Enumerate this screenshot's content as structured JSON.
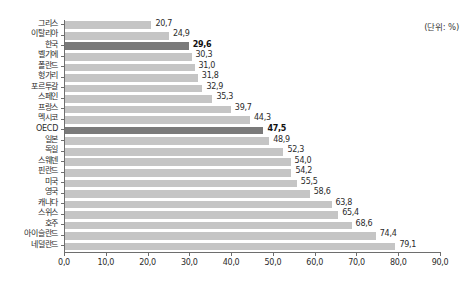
{
  "unit_note": "(단위: %)",
  "chart_data": {
    "type": "bar",
    "orientation": "horizontal",
    "title": "",
    "subtitle": "",
    "xlabel": "",
    "ylabel": "",
    "xlim": [
      0.0,
      90.0
    ],
    "xtick_step": 10.0,
    "grid": false,
    "legend": null,
    "decimal_separator": ",",
    "annotations": [
      "(단위: %)"
    ],
    "xtick_labels": [
      "0,0",
      "10,0",
      "20,0",
      "30,0",
      "40,0",
      "50,0",
      "60,0",
      "70,0",
      "80,0",
      "90,0"
    ],
    "xtick_values": [
      0,
      10,
      20,
      30,
      40,
      50,
      60,
      70,
      80,
      90
    ],
    "categories": [
      "그리스",
      "이탈리아",
      "한국",
      "벨기에",
      "폴란드",
      "헝가리",
      "포르투갈",
      "스페인",
      "프랑스",
      "멕시코",
      "OECD",
      "일본",
      "독일",
      "스웨덴",
      "핀란드",
      "미국",
      "영국",
      "캐나다",
      "스위스",
      "호주",
      "아이슬란드",
      "네덜란드"
    ],
    "values": [
      20.7,
      24.9,
      29.6,
      30.3,
      31.0,
      31.8,
      32.9,
      35.3,
      39.7,
      44.3,
      47.5,
      48.9,
      52.3,
      54.0,
      54.2,
      55.5,
      58.6,
      63.8,
      65.4,
      68.6,
      74.4,
      79.1
    ],
    "value_labels": [
      "20,7",
      "24,9",
      "29,6",
      "30,3",
      "31,0",
      "31,8",
      "32,9",
      "35,3",
      "39,7",
      "44,3",
      "47,5",
      "48,9",
      "52,3",
      "54,0",
      "54,2",
      "55,5",
      "58,6",
      "63,8",
      "65,4",
      "68,6",
      "74,4",
      "79,1"
    ],
    "highlighted": [
      "한국",
      "OECD"
    ],
    "colors": {
      "bar": "#c5c5c5",
      "bar_highlight": "#7a7a7a",
      "axis": "#6e6e6e",
      "text": "#2b2b2b",
      "background": "#ffffff"
    }
  }
}
